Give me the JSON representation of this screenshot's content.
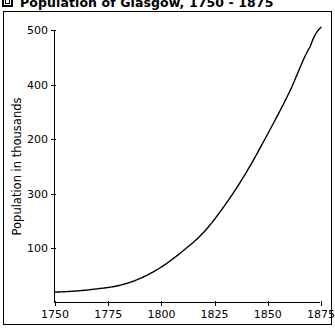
{
  "figure": {
    "title": "Population of Glasgow, 1750 - 1875",
    "title_icon": "square-bullet-icon"
  },
  "chart_data": {
    "type": "line",
    "title": "Population of Glasgow, 1750 - 1875",
    "xlabel": "",
    "ylabel": "Population in thousands",
    "xlim": [
      1750,
      1875
    ],
    "ylim": [
      0,
      500
    ],
    "grid": false,
    "legend": null,
    "x_ticks": [
      1750,
      1775,
      1800,
      1825,
      1850,
      1875
    ],
    "x_tick_labels": [
      "1750",
      "1775",
      "1800",
      "1825",
      "1850",
      "1875"
    ],
    "y_ticks": [
      100,
      200,
      300,
      400,
      500
    ],
    "y_tick_labels_top_to_bottom": [
      "500",
      "400",
      "200",
      "300",
      "100"
    ],
    "y_tick_label_at_100": "100",
    "y_tick_label_at_200": "300",
    "y_tick_label_at_300": "200",
    "y_tick_label_at_400": "400",
    "y_tick_label_at_500": "500",
    "series": [
      {
        "name": "Population of Glasgow",
        "color": "#000000",
        "x": [
          1750,
          1760,
          1770,
          1780,
          1790,
          1800,
          1810,
          1820,
          1830,
          1840,
          1850,
          1860,
          1870,
          1875
        ],
        "values": [
          20,
          22,
          26,
          32,
          45,
          66,
          95,
          130,
          180,
          240,
          310,
          385,
          470,
          505
        ]
      }
    ]
  }
}
